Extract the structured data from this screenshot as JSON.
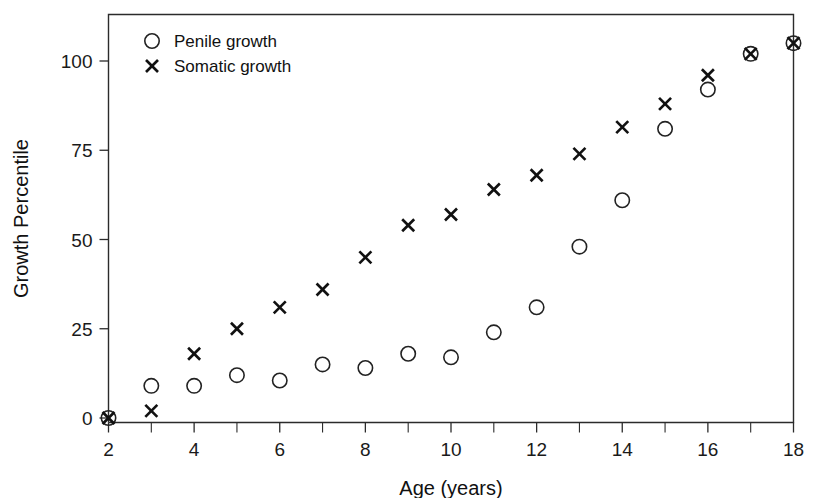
{
  "chart_data": {
    "type": "scatter",
    "title": "",
    "xlabel": "Age (years)",
    "ylabel": "Growth Percentile",
    "xlim": [
      2,
      18
    ],
    "ylim": [
      -3,
      113
    ],
    "xticks": [
      2,
      4,
      6,
      8,
      10,
      12,
      14,
      16,
      18
    ],
    "xtick_labels": [
      "2",
      "4",
      "6",
      "8",
      "10",
      "12",
      "14",
      "16",
      "18"
    ],
    "xminor_ticks": [
      3,
      5,
      7,
      9,
      11,
      13,
      15,
      17
    ],
    "yticks": [
      0,
      25,
      50,
      75,
      100
    ],
    "ytick_labels": [
      "0",
      "25",
      "50",
      "75",
      "100"
    ],
    "grid": false,
    "legend_position": "top-left",
    "x": [
      2,
      3,
      4,
      5,
      6,
      7,
      8,
      9,
      10,
      11,
      12,
      13,
      14,
      15,
      16,
      17,
      18
    ],
    "series": [
      {
        "name": "Penile growth",
        "marker": "circle",
        "values": [
          0,
          9,
          9,
          12,
          10.5,
          15,
          14,
          18,
          17,
          24,
          31,
          48,
          61,
          81,
          92,
          102,
          105
        ]
      },
      {
        "name": "Somatic growth",
        "marker": "x",
        "values": [
          0,
          2,
          18,
          25,
          31,
          36,
          45,
          54,
          57,
          64,
          68,
          74,
          81.5,
          88,
          96,
          102,
          105
        ]
      }
    ]
  },
  "legend": {
    "entries": [
      {
        "label": "Penile growth",
        "marker": "circle"
      },
      {
        "label": "Somatic growth",
        "marker": "x"
      }
    ]
  },
  "colors": {
    "axis": "#2b2b2b",
    "marker_circle": "#222222",
    "marker_x": "#111111",
    "background": "#ffffff"
  }
}
